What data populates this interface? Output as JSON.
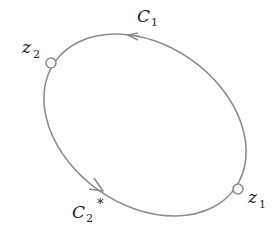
{
  "diagram": {
    "type": "closed contour (ellipse) with two marked points",
    "colors": {
      "curve": "#8c8c8c",
      "text": "#222222",
      "node_fill": "#ffffff"
    },
    "contour": {
      "center": [
        145,
        125
      ],
      "rx": 110,
      "ry": 80,
      "rotation_deg": 35
    },
    "points": [
      {
        "id": "z2",
        "base": "z",
        "sub": "2",
        "position": "upper-left"
      },
      {
        "id": "z1",
        "base": "z",
        "sub": "1",
        "position": "lower-right"
      }
    ],
    "arcs": [
      {
        "id": "C1",
        "base": "C",
        "sub": "1",
        "sup": "",
        "direction": "arrow pointing left along top arc"
      },
      {
        "id": "C2star",
        "base": "C",
        "sub": "2",
        "sup": "*",
        "direction": "arrow pointing down-right along lower-left arc"
      }
    ]
  }
}
